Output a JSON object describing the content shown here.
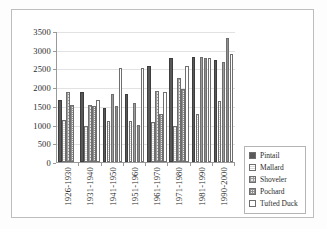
{
  "chart_data": {
    "type": "bar",
    "title": "",
    "xlabel": "",
    "ylabel": "",
    "ylim": [
      0,
      3500
    ],
    "yticks": [
      0,
      500,
      1000,
      1500,
      2000,
      2500,
      3000,
      3500
    ],
    "ytick_labels": [
      "0",
      "500",
      "1000",
      "1500",
      "2000",
      "2500",
      "3000",
      "3500"
    ],
    "grid": true,
    "legend_position": "right",
    "categories": [
      "1926-1930",
      "1931-1940",
      "1941-1950",
      "1951-1960",
      "1961-1970",
      "1971-1980",
      "1981-1990",
      "1990-2000"
    ],
    "series": [
      {
        "name": "Pintail",
        "color": "#595959",
        "pattern": "solid-dark",
        "values": [
          1660,
          1870,
          1450,
          1820,
          2570,
          2780,
          2810,
          2720
        ]
      },
      {
        "name": "Mallard",
        "color": "#d8d8d8",
        "pattern": "light-horizontal",
        "values": [
          1110,
          950,
          1100,
          1100,
          1080,
          950,
          1280,
          1620
        ]
      },
      {
        "name": "Shoveler",
        "color": "#e8e8e8",
        "pattern": "fine-grid",
        "values": [
          1860,
          1510,
          1830,
          1570,
          1910,
          2250,
          2800,
          2660
        ]
      },
      {
        "name": "Pochard",
        "color": "#ededed",
        "pattern": "dense-checker",
        "values": [
          1510,
          1500,
          1500,
          1000,
          1280,
          1940,
          2790,
          3320
        ]
      },
      {
        "name": "Tufted Duck",
        "color": "#ffffff",
        "pattern": "open-white",
        "values": [
          0,
          1670,
          2500,
          2500,
          1880,
          2570,
          2780,
          2880
        ]
      }
    ]
  },
  "legend": {
    "items": [
      {
        "label": "Pintail"
      },
      {
        "label": "Mallard"
      },
      {
        "label": "Shoveler"
      },
      {
        "label": "Pochard"
      },
      {
        "label": "Tufted Duck"
      }
    ]
  }
}
